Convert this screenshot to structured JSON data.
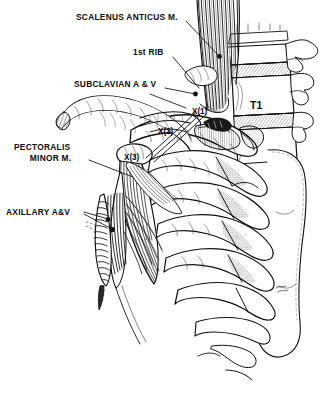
{
  "figure": {
    "background_color": "#ffffff",
    "ink_color": "#111111",
    "width": 323,
    "height": 400
  },
  "labels": [
    {
      "id": "scalenus-anticus",
      "text": "SCALENUS  ANTICUS  M.",
      "x": 76,
      "y": 12,
      "leader": {
        "x1": 186,
        "y1": 21,
        "x2": 219,
        "y2": 56,
        "dot": true
      }
    },
    {
      "id": "first-rib",
      "text": "1st  RIB",
      "x": 133,
      "y": 47,
      "leader": {
        "x1": 173,
        "y1": 57,
        "x2": 199,
        "y2": 88,
        "dot": false
      }
    },
    {
      "id": "subclavian-vessels",
      "text": "SUBCLAVIAN A & V",
      "x": 74,
      "y": 79,
      "leader": {
        "x1": 165,
        "y1": 88,
        "x2": 192,
        "y2": 93,
        "dot": true
      }
    },
    {
      "id": "axillary-vessels",
      "text": "AXILLARY  A&V",
      "x": 6,
      "y": 207,
      "leader": {
        "x1": 84,
        "y1": 213,
        "x2": 110,
        "y2": 220,
        "dot": true
      }
    }
  ],
  "multiline_labels": [
    {
      "id": "pectoralis-minor",
      "line1": "PECTORALIS",
      "line2": "MINOR M.",
      "x": 14,
      "y": 142,
      "leader": {
        "x1": 89,
        "y1": 160,
        "x2": 133,
        "y2": 177,
        "dot": false
      }
    }
  ],
  "compression_points": [
    {
      "id": "x1",
      "text": "X(1)",
      "x": 192,
      "y": 106
    },
    {
      "id": "x2",
      "text": "X(2)",
      "x": 158,
      "y": 126
    },
    {
      "id": "x3",
      "text": "X(3)",
      "x": 124,
      "y": 152
    }
  ],
  "vertebra_labels": [
    {
      "id": "t1",
      "text": "T1",
      "x": 250,
      "y": 99
    }
  ]
}
